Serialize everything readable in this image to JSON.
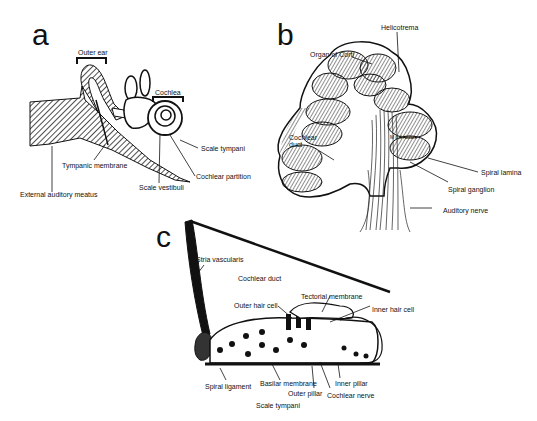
{
  "figure": {
    "panels": [
      {
        "letter": "a",
        "description": "Cross-section of the ear",
        "labels": {
          "outer_ear": "Outer ear",
          "cochlea": "Cochlea",
          "scale_tympani": "Scale tympani",
          "tympanic_membrane": "Tympanic membrane",
          "cochlear_partition": "Cochlear partition",
          "scale_vestibuli": "Scale vestibuli",
          "external_auditory_meatus": "External auditory meatus"
        }
      },
      {
        "letter": "b",
        "description": "Cross-section of the cochlea",
        "labels": {
          "helicotrema": "Helicotrema",
          "organ_of_corti": "Organ of Corti",
          "modiolus": "Modiolus",
          "cochlear_duct": "Cochlear duct",
          "spiral_lamina": "Spiral lamina",
          "spiral_ganglion": "Spiral ganglion",
          "auditory_nerve": "Auditory nerve"
        }
      },
      {
        "letter": "c",
        "description": "Cross-section of the cochlear duct and organ of Corti",
        "labels": {
          "stria_vascularis": "Stria vascularis",
          "cochlear_duct": "Cochlear duct",
          "tectorial_membrane": "Tectorial membrane",
          "outer_hair_cell": "Outer hair cell",
          "inner_hair_cell": "Inner hair cell",
          "spiral_ligament": "Spiral ligament",
          "basilar_membrane": "Basilar membrane",
          "inner_pillar": "Inner pillar",
          "outer_pillar": "Outer pillar",
          "cochlear_nerve": "Cochlear nerve",
          "scale_tympani": "Scale tympani"
        }
      }
    ]
  }
}
